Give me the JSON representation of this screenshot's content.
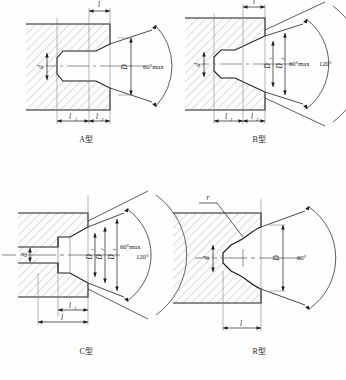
{
  "drawing": {
    "title": "Centre hole types",
    "line_color": "#1a1a1a",
    "hatch_color": "#9a9a9a",
    "background": "#fefefe"
  },
  "panels": [
    {
      "id": "A",
      "caption": "A型",
      "labels": {
        "top_dim": "l",
        "left_dim": "d",
        "right_dim": "D",
        "bottom_dim_1": "l",
        "bottom_dim_1_sub": "1",
        "bottom_dim_2": "l",
        "bottom_dim_2_sub": "2",
        "angle_main": "60°max"
      }
    },
    {
      "id": "B",
      "caption": "B型",
      "labels": {
        "top_dim": "l",
        "left_dim": "d",
        "dia_1": "D",
        "dia_1_sub": "1",
        "dia_2": "D",
        "dia_2_sub": "2",
        "bottom_dim_1": "l",
        "bottom_dim_1_sub": "1",
        "bottom_dim_2": "l",
        "bottom_dim_2_sub": "2",
        "angle_main": "60°max",
        "angle_outer": "120°"
      }
    },
    {
      "id": "C",
      "caption": "C型",
      "labels": {
        "left_dim": "d",
        "dia_1": "D",
        "dia_1_sub": "1",
        "dia_2": "D",
        "dia_2_sub": "2",
        "dia_3": "D",
        "dia_3_sub": "3",
        "bottom_dim_1": "l",
        "bottom_dim_1_sub": "1",
        "bottom_dim_2": "l",
        "angle_main": "60°max",
        "angle_outer": "120°"
      }
    },
    {
      "id": "R",
      "caption": "R型",
      "labels": {
        "radius": "r",
        "left_dim": "d",
        "right_dim": "D",
        "bottom_dim": "l",
        "angle_main": "60°"
      }
    }
  ]
}
